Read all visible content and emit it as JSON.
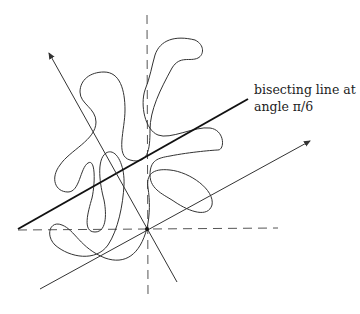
{
  "annotation": {
    "line1": "bisecting line at",
    "line2": "angle π/6"
  },
  "figure": {
    "colors": {
      "stroke": "#333333",
      "bold": "#111111",
      "dashed": "#555555"
    }
  }
}
